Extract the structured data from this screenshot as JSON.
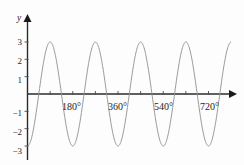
{
  "figure": {
    "axis_label_y": "y",
    "background_color": "#fdfdfd",
    "curve_color": "#8d8d8d",
    "axis_color": "#2b2b2b"
  },
  "y_axis": {
    "ticks": [
      {
        "label": "3",
        "value": 3
      },
      {
        "label": "2",
        "value": 2
      },
      {
        "label": "1",
        "value": 1
      },
      {
        "label": "−1",
        "value": -1
      },
      {
        "label": "−2",
        "value": -2
      },
      {
        "label": "−3",
        "value": -3
      }
    ]
  },
  "x_axis": {
    "ticks": [
      {
        "label": "",
        "value": 90
      },
      {
        "label": "180°",
        "value": 180
      },
      {
        "label": "",
        "value": 270
      },
      {
        "label": "360°",
        "value": 360
      },
      {
        "label": "",
        "value": 450
      },
      {
        "label": "540°",
        "value": 540
      },
      {
        "label": "",
        "value": 630
      },
      {
        "label": "720°",
        "value": 720
      }
    ]
  },
  "chart_data": {
    "type": "line",
    "title": "",
    "subtitle": "",
    "xlabel": "",
    "ylabel": "y",
    "xlim": [
      0,
      810
    ],
    "ylim": [
      -3.4,
      3.4
    ],
    "grid": false,
    "legend": null,
    "equation": "y = -3 cos(2x)",
    "amplitude": 3,
    "period_degrees": 180,
    "cycles_shown": 4,
    "x_tick_labels": [
      "180°",
      "360°",
      "540°",
      "720°"
    ],
    "y_tick_labels": [
      "3",
      "2",
      "1",
      "−1",
      "−2",
      "−3"
    ],
    "series": [
      {
        "name": "y = -3 cos(2x)",
        "x": [
          0,
          15,
          30,
          45,
          60,
          75,
          90,
          105,
          120,
          135,
          150,
          165,
          180,
          195,
          210,
          225,
          240,
          255,
          270,
          285,
          300,
          315,
          330,
          345,
          360,
          375,
          390,
          405,
          420,
          435,
          450,
          465,
          480,
          495,
          510,
          525,
          540,
          555,
          570,
          585,
          600,
          615,
          630,
          645,
          660,
          675,
          690,
          705,
          720,
          735,
          750,
          765,
          780
        ],
        "y": [
          -3,
          -2.598,
          -1.5,
          0,
          1.5,
          2.598,
          3,
          2.598,
          1.5,
          0,
          -1.5,
          -2.598,
          -3,
          -2.598,
          -1.5,
          0,
          1.5,
          2.598,
          3,
          2.598,
          1.5,
          0,
          -1.5,
          -2.598,
          -3,
          -2.598,
          -1.5,
          0,
          1.5,
          2.598,
          3,
          2.598,
          1.5,
          0,
          -1.5,
          -2.598,
          -3,
          -2.598,
          -1.5,
          0,
          1.5,
          2.598,
          3,
          2.598,
          1.5,
          0,
          -1.5,
          -2.598,
          -3,
          -2.598,
          -1.5,
          0,
          1.5
        ]
      }
    ]
  }
}
